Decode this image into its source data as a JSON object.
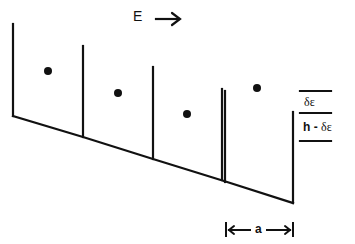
{
  "diagram": {
    "type": "tilted-potential-wells",
    "field_label": "E",
    "field_direction": "right",
    "labels": {
      "delta_epsilon": "δε",
      "h_minus": "h -",
      "h_delta_epsilon": "δε",
      "period": "a"
    },
    "walls_x": [
      13,
      83,
      153,
      224,
      293
    ],
    "particles": [
      {
        "x": 48,
        "y": 71
      },
      {
        "x": 118,
        "y": 93
      },
      {
        "x": 187,
        "y": 114
      },
      {
        "x": 257,
        "y": 88
      }
    ],
    "colors": {
      "ink": "#111111",
      "background": "#ffffff"
    }
  }
}
